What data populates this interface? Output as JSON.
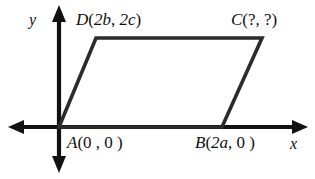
{
  "figure": {
    "background_color": "#ffffff",
    "stroke_color": "#2b2b2b",
    "axis_color": "#111111"
  },
  "axes": {
    "x_label": "x",
    "y_label": "y",
    "x_axis": {
      "x1": 8,
      "x2": 308,
      "y": 127
    },
    "y_axis": {
      "y1": 5,
      "y2": 173,
      "x": 59
    },
    "origin": {
      "x": 59,
      "y": 127
    }
  },
  "shape": {
    "type": "parallelogram",
    "name": "ABCD",
    "vertices": [
      {
        "id": "A",
        "label": "A(0 , 0 )",
        "px": 59,
        "py": 127
      },
      {
        "id": "B",
        "label": "B(2a, 0 )",
        "px": 222,
        "py": 127
      },
      {
        "id": "C",
        "label": "C(?, ?)",
        "px": 262,
        "py": 38
      },
      {
        "id": "D",
        "label": "D(2b, 2c)",
        "px": 96,
        "py": 38
      }
    ]
  },
  "labels": {
    "D": {
      "name": "D",
      "paren_open": "(",
      "coord_x": "2b",
      "comma": ",",
      "coord_y": "2c",
      "paren_close": ")"
    },
    "C": {
      "name": "C",
      "paren_open": "(",
      "coord_x": "?",
      "comma": ",",
      "coord_y": "?",
      "paren_close": ")"
    },
    "A": {
      "name": "A",
      "paren_open": "(",
      "coord_x": "0",
      "comma": ",",
      "coord_y": "0",
      "paren_close": ")"
    },
    "B": {
      "name": "B",
      "paren_open": "(",
      "coord_x": "2a",
      "comma": ",",
      "coord_y": "0",
      "paren_close": ")"
    }
  }
}
